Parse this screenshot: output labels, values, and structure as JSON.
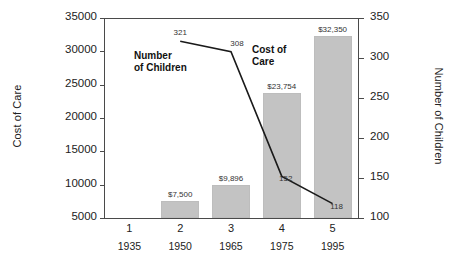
{
  "chart_data": {
    "type": "bar",
    "title": "",
    "categories": [
      "1",
      "2",
      "3",
      "4",
      "5"
    ],
    "x_sub_labels": [
      "1935",
      "1950",
      "1965",
      "1975",
      "1995"
    ],
    "xlabel": "",
    "grid": false,
    "legend_position": "inline-annotation",
    "axes": {
      "left": {
        "label": "Cost of Care",
        "ylim": [
          5000,
          35000
        ],
        "ticks": [
          5000,
          10000,
          15000,
          20000,
          25000,
          30000,
          35000
        ],
        "tick_labels": [
          "5000",
          "10000",
          "15000",
          "20000",
          "25000",
          "30000",
          "35000"
        ]
      },
      "right": {
        "label": "Number of Children",
        "ylim": [
          100,
          350
        ],
        "ticks": [
          100,
          150,
          200,
          250,
          300,
          350
        ],
        "tick_labels": [
          "100",
          "150",
          "200",
          "250",
          "300",
          "350"
        ]
      }
    },
    "series": [
      {
        "name": "Cost of Care",
        "type": "bar",
        "axis": "left",
        "color": "#c3c3c3",
        "values": [
          null,
          7500,
          9896,
          23754,
          32350
        ],
        "data_labels": [
          "",
          "$7,500",
          "$9,896",
          "$23,754",
          "$32,350"
        ],
        "annotation": "Cost of\nCare"
      },
      {
        "name": "Number of Children",
        "type": "line",
        "axis": "right",
        "color": "#1a1a1a",
        "values": [
          null,
          321,
          308,
          152,
          118
        ],
        "data_labels": [
          "",
          "321",
          "308",
          "152",
          "118"
        ],
        "annotation": "Number\nof Children"
      }
    ]
  }
}
